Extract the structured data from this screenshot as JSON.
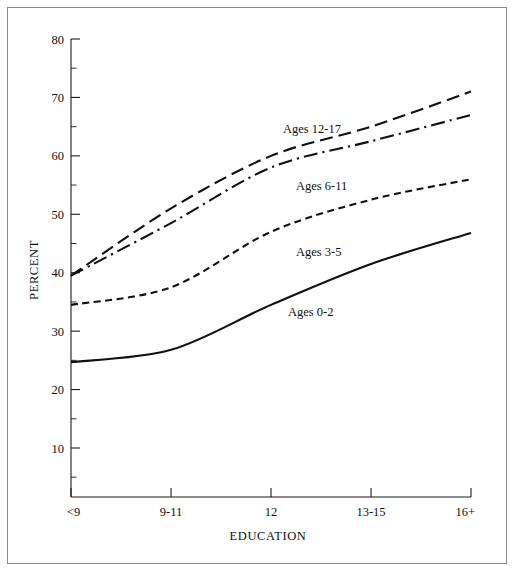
{
  "figure": {
    "border_color": "#8a8a8a",
    "ink_color": "#101010"
  },
  "chart_data": {
    "type": "line",
    "title": "",
    "xlabel": "EDUCATION",
    "ylabel": "PERCENT",
    "categories": [
      "<9",
      "9-11",
      "12",
      "13-15",
      "16+"
    ],
    "ylim": [
      0,
      80
    ],
    "ytick_major": [
      10,
      20,
      30,
      40,
      50,
      60,
      70,
      80
    ],
    "ytick_minor": [
      5,
      15,
      25,
      35,
      45,
      55,
      65,
      75
    ],
    "grid": false,
    "legend": "inline-labels",
    "series": [
      {
        "name": "Ages 12-17",
        "style": "long-dash",
        "values": [
          39.5,
          51.0,
          60.0,
          65.0,
          71.0
        ],
        "label": "Ages 12-17"
      },
      {
        "name": "Ages 6-11",
        "style": "dash-dot",
        "values": [
          39.5,
          48.5,
          58.0,
          62.5,
          67.0
        ],
        "label": "Ages 6-11"
      },
      {
        "name": "Ages 3-5",
        "style": "short-dash",
        "values": [
          34.5,
          37.5,
          47.0,
          52.5,
          56.0
        ],
        "label": "Ages 3-5"
      },
      {
        "name": "Ages 0-2",
        "style": "solid",
        "values": [
          24.7,
          26.8,
          34.5,
          41.5,
          46.8
        ],
        "label": "Ages 0-2"
      }
    ]
  },
  "axis": {
    "y_labels": [
      "80",
      "70",
      "60",
      "50",
      "40",
      "30",
      "20",
      "10"
    ],
    "x_labels": [
      "<9",
      "9-11",
      "12",
      "13-15",
      "16+"
    ],
    "y_title": "PERCENT",
    "x_title": "EDUCATION"
  },
  "series_labels": {
    "ages_12_17": "Ages 12-17",
    "ages_6_11": "Ages 6-11",
    "ages_3_5": "Ages 3-5",
    "ages_0_2": "Ages 0-2"
  }
}
